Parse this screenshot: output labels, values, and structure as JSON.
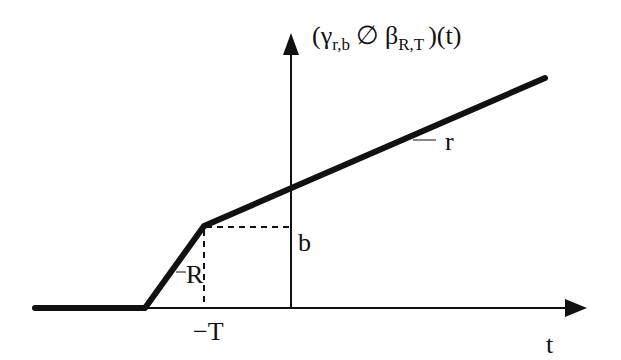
{
  "diagram": {
    "title": {
      "open": "(",
      "gamma": "γ",
      "gamma_sub": "r,b",
      "op": "∅",
      "beta": "β",
      "beta_sub": "R,T",
      "close": ")(t)"
    },
    "x_axis_label": "t",
    "x_tick_label": "−T",
    "y_level_label": "b",
    "slope_steep_label": "R",
    "slope_shallow_label": "r",
    "colors": {
      "stroke": "#111111",
      "background": "#ffffff"
    }
  }
}
